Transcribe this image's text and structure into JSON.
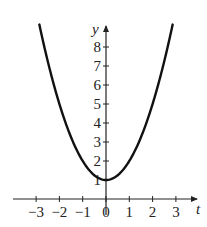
{
  "chart_data": {
    "type": "line",
    "title": "",
    "function": "y = t^2 + 1",
    "xlabel": "t",
    "ylabel": "y",
    "xlim": [
      -3.7,
      3.9
    ],
    "ylim": [
      0,
      9.3
    ],
    "x_ticks": [
      -3,
      -2,
      -1,
      0,
      1,
      2,
      3
    ],
    "x_tick_labels": [
      "−3",
      "−2",
      "−1",
      "0",
      "1",
      "2",
      "3"
    ],
    "y_ticks": [
      1,
      2,
      3,
      4,
      5,
      6,
      7,
      8
    ],
    "y_tick_labels": [
      "1",
      "2",
      "3",
      "4",
      "5",
      "6",
      "7",
      "8"
    ],
    "grid": false,
    "legend": null,
    "series": [
      {
        "name": "y = t^2 + 1",
        "x": [
          -2.86,
          -2.5,
          -2,
          -1.5,
          -1,
          -0.5,
          0,
          0.5,
          1,
          1.5,
          2,
          2.5,
          2.86
        ],
        "y": [
          9.18,
          7.25,
          5,
          3.25,
          2,
          1.25,
          1,
          1.25,
          2,
          3.25,
          5,
          7.25,
          9.18
        ],
        "color": "#111111"
      }
    ]
  }
}
